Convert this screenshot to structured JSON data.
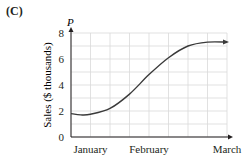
{
  "panel_label": "(C)",
  "chart_data": {
    "type": "line",
    "title": "",
    "xlabel": "",
    "ylabel": "Sales ($ thousands)",
    "y_axis_symbol": "P",
    "ylim": [
      0,
      8
    ],
    "y_ticks": [
      "0",
      "2",
      "4",
      "6",
      "8"
    ],
    "x_tick_labels": [
      "January",
      "February",
      "March"
    ],
    "x_tick_positions": [
      1,
      4,
      8
    ],
    "xlim": [
      0,
      8
    ],
    "grid": true,
    "series": [
      {
        "name": "P",
        "x": [
          0,
          0.5,
          1,
          2,
          3,
          4,
          5,
          6,
          7,
          8
        ],
        "values": [
          1.8,
          1.7,
          1.75,
          2.2,
          3.3,
          4.8,
          6.1,
          7.0,
          7.3,
          7.3
        ]
      }
    ],
    "line_color": "#3a3a3a",
    "grid_color": "#d9d9d9"
  }
}
